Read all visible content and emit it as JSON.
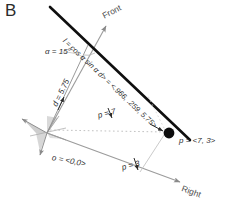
{
  "figure": {
    "panel_letter": "B",
    "axes": {
      "front_label": "Front",
      "right_label": "Right"
    },
    "annotations": {
      "line_vector": "l = cos α sin α d> = <.966, .259, 5.75>",
      "angle": "α = 15°",
      "distance": "d = 5.75",
      "p_x_component": "p = 7",
      "p_y_component": "p = 3",
      "point_p": "p = <7, 3>",
      "origin": "o = <0,0>"
    },
    "colors": {
      "line": "#111111",
      "axis": "#8a8a8a",
      "guide": "#b4b4b4",
      "point": "#0d0d0d",
      "text": "#2e2e2e",
      "background": "#ffffff"
    },
    "points": {
      "origin": {
        "x": 0,
        "y": 0
      },
      "p": {
        "x": 7,
        "y": 3
      }
    }
  }
}
